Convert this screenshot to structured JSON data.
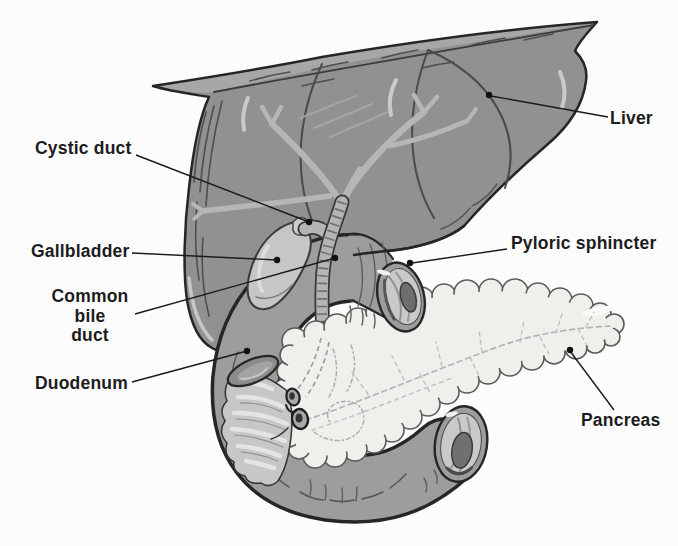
{
  "figure": {
    "labels": {
      "liver": "Liver",
      "cystic_duct": "Cystic duct",
      "gallbladder": "Gallbladder",
      "common_bile_duct": {
        "lines": [
          "Common",
          "bile",
          "duct"
        ]
      },
      "duodenum": "Duodenum",
      "pyloric_sphincter": "Pyloric sphincter",
      "pancreas": "Pancreas"
    },
    "colors": {
      "background": "#fcfcfc",
      "liver": "#8f9193",
      "liver_flap": "#a6a7a7",
      "outline": "#262626",
      "bile_tree": "#b6b6b6",
      "gallbladder": "#c5c6c5",
      "duct_band": "#b4b4b4",
      "duodenum": "#9c9d9d",
      "cut_face": "#c9c9c9",
      "lumen": "#6e6e6e",
      "mucosa": "#c6c7c6",
      "pleat": "#e4e4e2",
      "pancreas": "#efefec",
      "pancreas_outline": "#5a5a5a",
      "leader": "#1a1a1a",
      "label_text": "#1c1c1c"
    }
  }
}
